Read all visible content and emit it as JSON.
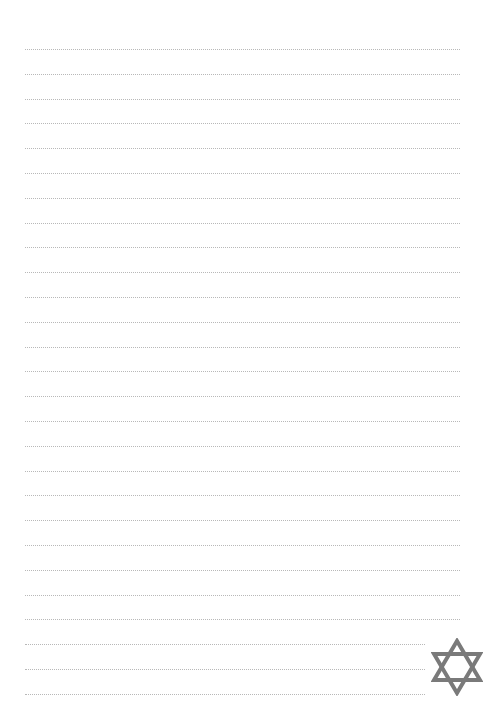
{
  "page": {
    "type": "lined-notepaper",
    "background": "#ffffff",
    "line_color": "#b8b8b8",
    "line_style": "dotted",
    "line_count": 27,
    "first_line_y": 49,
    "line_spacing": 24.8,
    "line_left": 25,
    "line_right": 460,
    "short_line_right": 425,
    "short_line_count": 3
  },
  "ornament": {
    "icon": "star-of-david-icon",
    "color": "#7a7a7a"
  }
}
